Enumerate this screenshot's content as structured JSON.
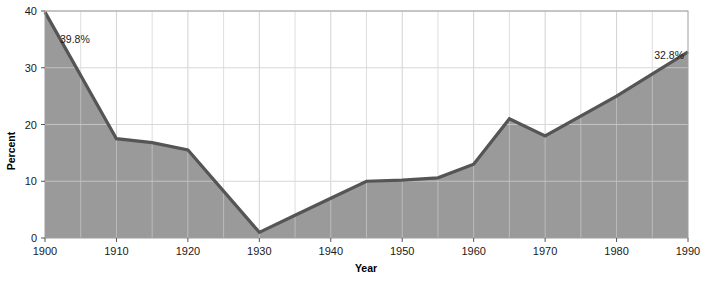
{
  "chart_data": {
    "type": "area",
    "title": "",
    "xlabel": "Year",
    "ylabel": "Percent",
    "xlim": [
      1900,
      1990
    ],
    "ylim": [
      0,
      40
    ],
    "xticks": [
      1900,
      1910,
      1920,
      1930,
      1940,
      1950,
      1960,
      1970,
      1980,
      1990
    ],
    "xticklabels": [
      "1900",
      "1910",
      "1920",
      "1930",
      "1940",
      "1950",
      "1960",
      "1970",
      "1980",
      "1990"
    ],
    "yticks": [
      0,
      10,
      20,
      30,
      40
    ],
    "yticklabels": [
      "0",
      "10",
      "20",
      "30",
      "40"
    ],
    "grid": true,
    "grid_minor_x_step": 5,
    "legend": "none",
    "x": [
      1900,
      1910,
      1915,
      1920,
      1930,
      1935,
      1940,
      1945,
      1950,
      1955,
      1960,
      1965,
      1970,
      1980,
      1990
    ],
    "values": [
      39.8,
      17.5,
      16.8,
      15.5,
      1.0,
      4.0,
      7.0,
      10.0,
      10.2,
      10.6,
      13.0,
      21.0,
      18.0,
      25.0,
      32.8
    ],
    "series": [
      {
        "name": "Percent foreign born",
        "values": [
          39.8,
          17.5,
          16.8,
          15.5,
          1.0,
          4.0,
          7.0,
          10.0,
          10.2,
          10.6,
          13.0,
          21.0,
          18.0,
          25.0,
          32.8
        ]
      }
    ],
    "annotations": [
      {
        "id": "start-value",
        "text": "39.8%",
        "x": 1900,
        "y": 39.8
      },
      {
        "id": "end-value",
        "text": "32.8%",
        "x": 1990,
        "y": 32.8
      }
    ],
    "colors": {
      "area_fill": "#9a9a9a",
      "line": "#555555",
      "grid": "#cfcfcf",
      "axis": "#7a7a7a",
      "text": "#1a1a1a",
      "background": "#ffffff"
    }
  }
}
